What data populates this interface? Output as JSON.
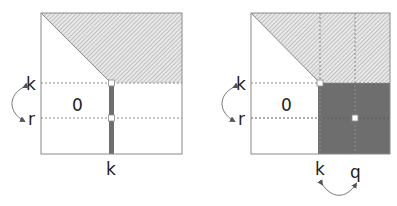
{
  "figure": {
    "colors": {
      "border": "#8a8a8a",
      "hatch_bg": "#e6e6e6",
      "hatch_line": "#9a9a9a",
      "dark_fill": "#6e6e6e",
      "dotted": "#8a8a8a",
      "text": "#222222",
      "arrow": "#777777"
    }
  },
  "left_panel": {
    "zero_label": "0",
    "row_labels": {
      "k": "k",
      "r": "r"
    },
    "col_label": "k"
  },
  "right_panel": {
    "zero_label": "0",
    "row_labels": {
      "k": "k",
      "r": "r"
    },
    "col_labels": {
      "k": "k",
      "q": "q"
    }
  }
}
